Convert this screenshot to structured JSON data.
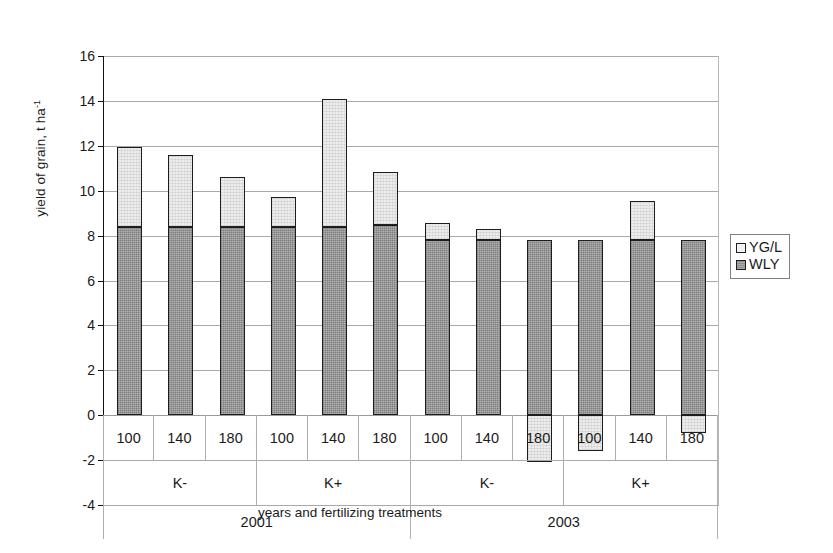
{
  "chart_data": {
    "type": "bar",
    "subtype": "stacked",
    "title": "",
    "xlabel": "years and fertilizing treatments",
    "ylabel": "yield of grain, t ha-1",
    "ylabel_base": "yield of grain, t ha",
    "ylabel_sup": "-1",
    "ylim": [
      -4,
      16
    ],
    "ytick_step": 2,
    "yticks": [
      16,
      14,
      12,
      10,
      8,
      6,
      4,
      2,
      0,
      -2,
      -4
    ],
    "ytick_labels": [
      "16",
      "14",
      "12",
      "10",
      "8",
      "6",
      "4",
      "2",
      "0",
      "-2",
      "-4"
    ],
    "grid": true,
    "legend_position": "right",
    "categories": [
      "100",
      "140",
      "180",
      "100",
      "140",
      "180",
      "100",
      "140",
      "180",
      "100",
      "140",
      "180"
    ],
    "group_labels_potassium": [
      "K-",
      "K+",
      "K-",
      "K+"
    ],
    "group_labels_years": [
      "2001",
      "2003"
    ],
    "series": [
      {
        "name": "WLY",
        "color": "#8c8c8c",
        "values": [
          8.4,
          8.4,
          8.4,
          8.4,
          8.4,
          8.45,
          7.8,
          7.8,
          7.8,
          7.8,
          7.8,
          7.8
        ]
      },
      {
        "name": "YG/L",
        "color": "#ececec",
        "values": [
          3.55,
          3.2,
          2.2,
          1.3,
          5.7,
          2.4,
          0.75,
          0.5,
          -2.1,
          -1.6,
          1.75,
          -0.8
        ]
      }
    ],
    "totals": [
      11.95,
      11.6,
      10.6,
      9.7,
      14.1,
      10.85,
      8.55,
      8.3,
      7.8,
      7.8,
      9.55,
      7.8
    ]
  },
  "legend": {
    "items": [
      {
        "label": "YG/L",
        "swatch": "light-square-icon"
      },
      {
        "label": "WLY",
        "swatch": "dark-square-icon"
      }
    ]
  },
  "axis": {
    "x_title": "years and fertilizing treatments",
    "y_title_base": "yield of grain, t ha",
    "y_title_sup": "-1"
  },
  "category_axis": {
    "rates": [
      "100",
      "140",
      "180",
      "100",
      "140",
      "180",
      "100",
      "140",
      "180",
      "100",
      "140",
      "180"
    ],
    "potassium": [
      "K-",
      "K+",
      "K-",
      "K+"
    ],
    "years": [
      "2001",
      "2003"
    ]
  }
}
